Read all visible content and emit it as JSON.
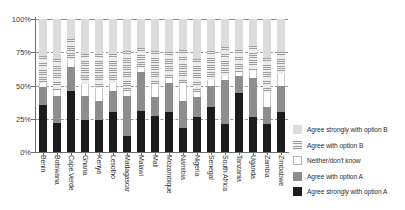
{
  "chart_data": {
    "type": "bar",
    "subtype": "stacked-bar-100-percent",
    "title": "",
    "subtitle": "",
    "xlabel": "",
    "ylabel": "",
    "ylim": [
      0,
      100
    ],
    "ytick_labels": [
      "0%",
      "25%",
      "50%",
      "75%",
      "100%"
    ],
    "ytick_values": [
      0,
      25,
      50,
      75,
      100
    ],
    "grid": true,
    "grid_axis": "y",
    "legend_position": "right",
    "orientation": "vertical",
    "categories": [
      "Benin",
      "Botswana",
      "Cape Verde",
      "Ghana",
      "Kenya",
      "Lesotho",
      "Madagascar",
      "Malawi",
      "Mali",
      "Mozambique",
      "Namibia",
      "Nigeria",
      "Senegal",
      "South Africa",
      "Tanzania",
      "Uganda",
      "Zambia",
      "Zimbabwe"
    ],
    "series": [
      {
        "name": "Agree strongly with option A",
        "key": "agree_strongly_a",
        "color": "#1c1c1c",
        "values": [
          35,
          22,
          46,
          24,
          24,
          30,
          12,
          31,
          27,
          30,
          18,
          26,
          34,
          21,
          44,
          26,
          21,
          30
        ]
      },
      {
        "name": "Agree with option A",
        "key": "agree_a",
        "color": "#8d8d8d",
        "values": [
          14,
          20,
          18,
          18,
          14,
          16,
          30,
          29,
          14,
          22,
          20,
          15,
          16,
          33,
          13,
          30,
          13,
          20
        ]
      },
      {
        "name": "Neither/don't know",
        "key": "neither_dont_know",
        "color": "#ffffff",
        "values": [
          3,
          5,
          5,
          9,
          10,
          6,
          4,
          3,
          10,
          4,
          14,
          4,
          4,
          3,
          3,
          6,
          11,
          9
        ]
      },
      {
        "name": "Agree with option B",
        "key": "agree_b",
        "color": "#9e9e9e",
        "values": [
          20,
          23,
          16,
          23,
          26,
          22,
          30,
          15,
          25,
          19,
          25,
          25,
          22,
          22,
          17,
          18,
          26,
          16
        ]
      },
      {
        "name": "Agree strongly with option B",
        "key": "agree_strongly_b",
        "color": "#dcdcdc",
        "values": [
          28,
          30,
          15,
          26,
          26,
          26,
          24,
          22,
          24,
          25,
          23,
          30,
          24,
          21,
          23,
          20,
          29,
          25
        ]
      }
    ],
    "legend": [
      {
        "label": "Agree strongly with option B",
        "swatch": "sb"
      },
      {
        "label": "Agree with option B",
        "swatch": "b"
      },
      {
        "label": "Neither/don't know",
        "swatch": "n"
      },
      {
        "label": "Agree with option A",
        "swatch": "a"
      },
      {
        "label": "Agree strongly with option A",
        "swatch": "sa"
      }
    ]
  }
}
